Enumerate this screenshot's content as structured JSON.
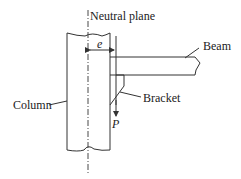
{
  "diagram": {
    "type": "engineering-schematic",
    "labels": {
      "neutral_plane": "Neutral plane",
      "eccentricity": "e",
      "beam": "Beam",
      "column": "Column",
      "bracket": "Bracket",
      "load": "P"
    },
    "colors": {
      "line": "#333333",
      "text": "#222222",
      "background": "#ffffff"
    }
  }
}
